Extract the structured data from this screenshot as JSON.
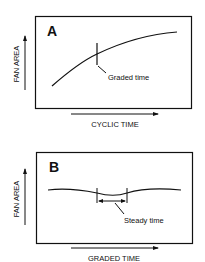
{
  "panels": [
    {
      "letter": "A",
      "y_axis_label": "FAN AREA",
      "x_axis_label": "CYCLIC TIME",
      "annotation": "Graded time",
      "curve_shape": "increasing, concave-down"
    },
    {
      "letter": "B",
      "y_axis_label": "FAN AREA",
      "x_axis_label": "GRADED TIME",
      "annotation": "Steady time",
      "curve_shape": "nearly flat, slight wave"
    }
  ],
  "colors": {
    "line": "#111111",
    "background": "#ffffff"
  }
}
